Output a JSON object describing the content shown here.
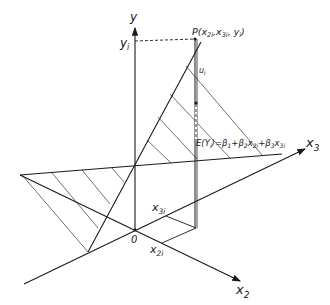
{
  "diagram": {
    "type": "3d-regression-plane",
    "axes": {
      "y_label": "y",
      "x2_label": "x",
      "x2_sub": "2",
      "x3_label": "x",
      "x3_sub": "3",
      "origin_label": "0"
    },
    "point": {
      "label": "P(x",
      "label_full": "P(x2i, x3i, yi)",
      "part1": "P(x",
      "sub1": "2i",
      "part2": ",x",
      "sub2": "3i",
      "part3": ", y",
      "sub3": "i",
      "part4": ")"
    },
    "yi_label": "y",
    "yi_sub": "i",
    "ui_label": "u",
    "ui_sub": "i",
    "x2i_label": "x",
    "x2i_sub": "2i",
    "x3i_label": "x",
    "x3i_sub": "3i",
    "equation": {
      "full": "E(Yi) = β1 + β2x2i + β3x3i",
      "p1": "E(Y",
      "s1": "i",
      "p2": ")=β",
      "s2": "1",
      "p3": "+β",
      "s3": "2",
      "p4": "x",
      "s4": "2i",
      "p5": "+β",
      "s5": "3",
      "p6": "x",
      "s6": "3i"
    },
    "colors": {
      "line": "#1a1a1a",
      "background": "#ffffff"
    }
  }
}
